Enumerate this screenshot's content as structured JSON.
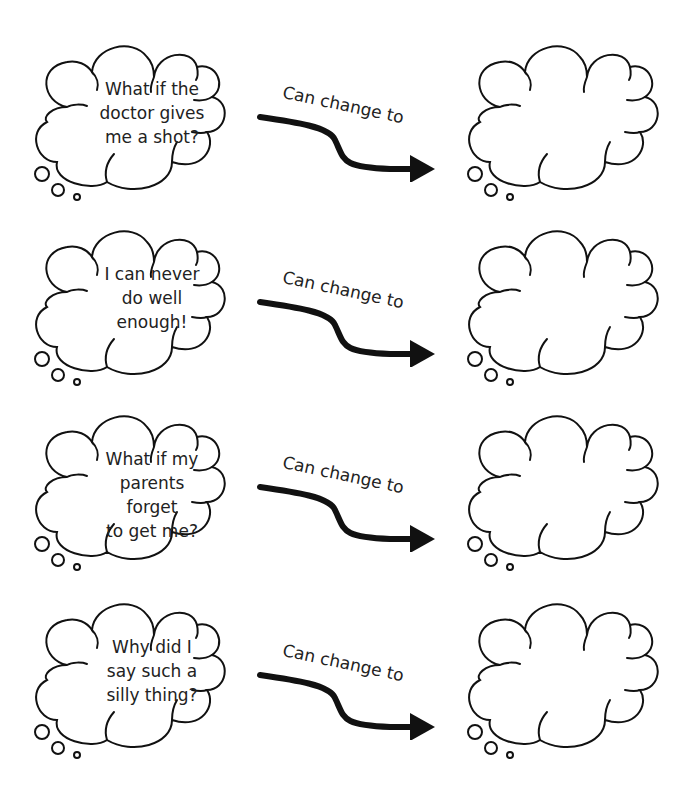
{
  "worksheet": {
    "arrow_label": "Can change to",
    "rows": [
      {
        "thought": [
          "What if the",
          "doctor gives",
          "me a shot?"
        ],
        "replacement": ""
      },
      {
        "thought": [
          "I can never",
          "do well enough!"
        ],
        "replacement": ""
      },
      {
        "thought": [
          "What if my",
          "parents forget",
          "to get me?"
        ],
        "replacement": ""
      },
      {
        "thought": [
          "Why did I",
          "say such a",
          "silly thing?"
        ],
        "replacement": ""
      }
    ]
  },
  "colors": {
    "stroke": "#111111",
    "text": "#222222",
    "background": "#ffffff"
  }
}
